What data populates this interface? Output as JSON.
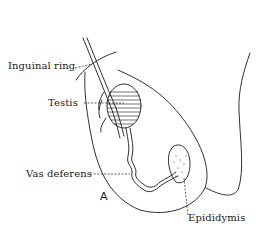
{
  "figure": {
    "panel_letter": "A",
    "labels": {
      "inguinal_ring": "Inguinal ring",
      "testis": "Testis",
      "vas_deferens": "Vas deferens",
      "epididymis": "Epididymis"
    },
    "colors": {
      "line": "#1a1a1a",
      "background": "#ffffff"
    }
  }
}
